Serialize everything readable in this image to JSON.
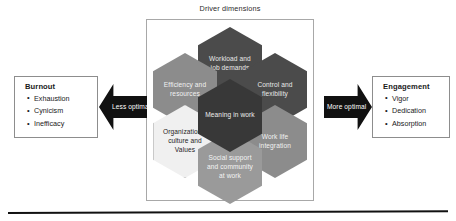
{
  "diagram": {
    "driver_panel": {
      "title": "Driver dimensions",
      "hexagons": [
        {
          "id": "workload",
          "label": "Workload and job demands",
          "tone": "dark"
        },
        {
          "id": "efficiency",
          "label": "Efficiency and resources",
          "tone": "mid"
        },
        {
          "id": "control",
          "label": "Control and flexibility",
          "tone": "dark"
        },
        {
          "id": "meaning",
          "label": "Meaning in work",
          "tone": "core"
        },
        {
          "id": "culture",
          "label": "Organizational culture and Values",
          "tone": "light"
        },
        {
          "id": "worklife",
          "label": "Work life integration",
          "tone": "mid"
        },
        {
          "id": "social",
          "label": "Social support and community at work",
          "tone": "mid2"
        }
      ]
    },
    "left_outcome": {
      "title": "Burnout",
      "items": [
        "Exhaustion",
        "Cynicism",
        "Inefficacy"
      ]
    },
    "right_outcome": {
      "title": "Engagement",
      "items": [
        "Vigor",
        "Dedication",
        "Absorption"
      ]
    },
    "arrows": {
      "left_label": "Less optimal",
      "right_label": "More optimal"
    },
    "colors": {
      "hex_dark": "#4b4b4b",
      "hex_core": "#383838",
      "hex_mid": "#8c8c8c",
      "hex_mid2": "#9a9a9a",
      "hex_light": "#f0f0f0",
      "arrow": "#111111",
      "box_border": "#8d8d8d",
      "panel_border": "#a8a8a8"
    }
  }
}
